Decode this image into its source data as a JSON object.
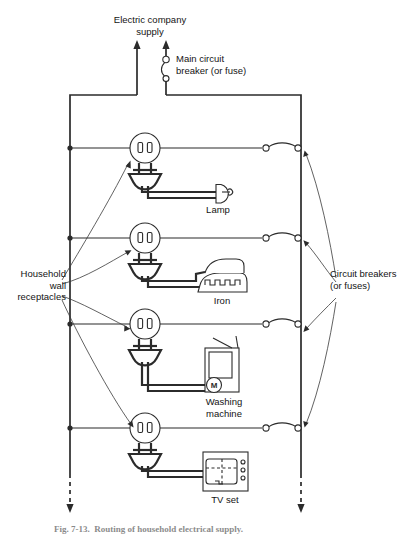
{
  "figure": {
    "title_top": "Electric company\nsupply",
    "main_breaker_label": "Main circuit\nbreaker (or fuse)",
    "left_label": "Household\nwall\nreceptacles",
    "right_label": "Circuit breakers\n(or fuses)",
    "caption": "Fig. 7-13.  Routing of household electrical supply."
  },
  "branches": [
    {
      "appliance": "Lamp",
      "icon": "lamp-icon"
    },
    {
      "appliance": "Iron",
      "icon": "iron-icon"
    },
    {
      "appliance": "Washing\nmachine",
      "icon": "washing-machine-icon"
    },
    {
      "appliance": "TV set",
      "icon": "tv-set-icon"
    }
  ],
  "symbols": {
    "motor": "M",
    "receptacle": "wall-receptacle-icon",
    "plug": "plug-icon",
    "breaker": "circuit-breaker-icon"
  },
  "colors": {
    "line": "#2b2b2b",
    "text": "#141414",
    "background": "#ffffff"
  }
}
